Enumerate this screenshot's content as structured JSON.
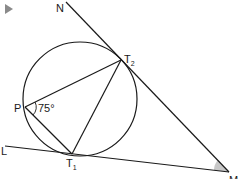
{
  "diagram": {
    "play_button_color": "#8a8a8a",
    "labels": {
      "N": "N",
      "T2": "T",
      "T2_sub": "2",
      "P": "P",
      "angle_P": "75°",
      "L": "L",
      "T1": "T",
      "T1_sub": "1",
      "M": "M"
    },
    "shaded_angle_color": "#c8c8c8",
    "line_color": "#1a1a1a"
  }
}
